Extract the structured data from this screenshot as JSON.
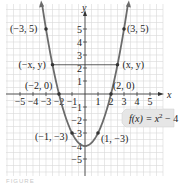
{
  "chart_data": {
    "type": "line",
    "title": "",
    "function_label": "f(x) = x² − 4",
    "function_label_parts": {
      "f": "f(x) = x",
      "exp": "2",
      "rest": " − 4"
    },
    "xlabel": "x",
    "ylabel": "y",
    "xlim": [
      -5.5,
      5.5
    ],
    "ylim": [
      -6,
      6
    ],
    "grid": true,
    "x_ticks": [
      -5,
      -4,
      -3,
      -2,
      -1,
      1,
      2,
      3,
      4,
      5
    ],
    "x_tick_labels": [
      "−5",
      "−4",
      "−3",
      "−2",
      "−1",
      "1",
      "2",
      "3",
      "4",
      "5"
    ],
    "y_ticks": [
      5,
      4,
      3,
      2,
      1,
      -1,
      -2,
      -3,
      -4,
      -5
    ],
    "y_tick_labels": [
      "5",
      "4",
      "3",
      "2",
      "1",
      "−1",
      "−2",
      "−3",
      "−4",
      "−5"
    ],
    "series": [
      {
        "name": "f(x) = x^2 - 4",
        "x": [
          -3,
          -2,
          -1,
          0,
          1,
          2,
          3
        ],
        "values": [
          5,
          0,
          -3,
          -4,
          -3,
          0,
          5
        ]
      }
    ],
    "annotations": [
      {
        "text": "(−3, 5)",
        "x": -3,
        "y": 5
      },
      {
        "text": "(3, 5)",
        "x": 3,
        "y": 5
      },
      {
        "text": "(−x, y)",
        "x": -2.5,
        "y": 2.25
      },
      {
        "text": "(x, y)",
        "x": 2.5,
        "y": 2.25
      },
      {
        "text": "(−2, 0)",
        "x": -2,
        "y": 0
      },
      {
        "text": "(2, 0)",
        "x": 2,
        "y": 0
      },
      {
        "text": "(−1, −3)",
        "x": -1,
        "y": -3
      },
      {
        "text": "(1, −3)",
        "x": 1,
        "y": -3
      }
    ],
    "symmetry_segment": {
      "from": [
        -2.5,
        2.25
      ],
      "to": [
        2.5,
        2.25
      ]
    }
  },
  "colors": {
    "curve": "#6b6b6b",
    "grid": "#d8d8d8",
    "axis": "#333333",
    "label_box": "#e6e6e6"
  },
  "caption": "FIGURE"
}
